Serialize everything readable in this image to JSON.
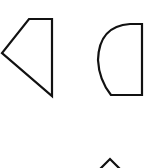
{
  "diagram": {
    "background": "#ffffff",
    "stroke_color": "#111111",
    "shapes": [
      {
        "name": "trapezoid-pentagon",
        "type": "polygon",
        "points": "29,19 52,19 52,96 2,53"
      },
      {
        "name": "half-disc",
        "type": "path",
        "d": "M 142,24 L 142,95 L 111,95 Q 99,80 98,60 Q 99,26 130,24 Z"
      },
      {
        "name": "partial-triangle",
        "type": "polyline",
        "points": "97,172 110,159 123,172"
      }
    ]
  }
}
